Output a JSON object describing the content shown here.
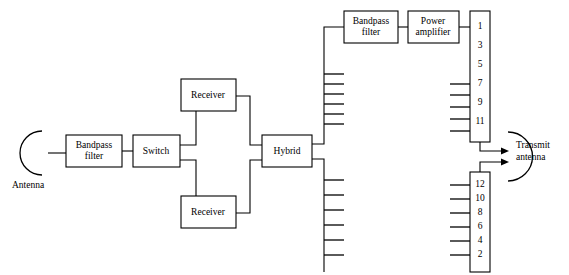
{
  "diagram": {
    "background_color": "#ffffff",
    "line_color": "#000000",
    "blocks": [
      {
        "id": "bandpass_filter_rx",
        "name": "bandpass-filter-receive",
        "line1": "Bandpass",
        "line2": "filter",
        "x": 66,
        "y": 135,
        "w": 56,
        "h": 32
      },
      {
        "id": "switch",
        "name": "switch",
        "line1": "Switch",
        "line2": "",
        "x": 133,
        "y": 135,
        "w": 47,
        "h": 32
      },
      {
        "id": "receiver_top",
        "name": "receiver-top",
        "line1": "Receiver",
        "line2": "",
        "x": 181,
        "y": 79,
        "w": 55,
        "h": 32
      },
      {
        "id": "receiver_bottom",
        "name": "receiver-bottom",
        "line1": "Receiver",
        "line2": "",
        "x": 181,
        "y": 196,
        "w": 55,
        "h": 32
      },
      {
        "id": "hybrid",
        "name": "hybrid",
        "line1": "Hybrid",
        "line2": "",
        "x": 262,
        "y": 135,
        "w": 50,
        "h": 32
      },
      {
        "id": "bandpass_filter_tx",
        "name": "bandpass-filter-transmit",
        "line1": "Bandpass",
        "line2": "filter",
        "x": 344,
        "y": 11,
        "w": 54,
        "h": 32
      },
      {
        "id": "power_amplifier",
        "name": "power-amplifier",
        "line1": "Power",
        "line2": "amplifier",
        "x": 408,
        "y": 11,
        "w": 51,
        "h": 32
      }
    ],
    "port_arrays": [
      {
        "id": "array_odd",
        "name": "port-array-odd",
        "x": 470,
        "y": 11,
        "w": 20,
        "h": 131,
        "ports": [
          "1",
          "3",
          "5",
          "7",
          "9",
          "11"
        ],
        "fed_ports": [
          "7",
          "9",
          "11"
        ],
        "stub_count": 4
      },
      {
        "id": "array_even",
        "name": "port-array-even",
        "x": 470,
        "y": 172,
        "w": 20,
        "h": 100,
        "ports": [
          "12",
          "10",
          "8",
          "6",
          "4",
          "2"
        ],
        "stub_count": 6
      }
    ],
    "antennas": [
      {
        "id": "antenna_rx",
        "name": "antenna-receive",
        "label": "Antenna",
        "label_x": 12,
        "label_y": 186
      },
      {
        "id": "antenna_tx",
        "name": "antenna-transmit",
        "label_line1": "Transmit",
        "label_line2": "antenna",
        "label_x": 516,
        "label_y": 143
      }
    ],
    "bus_stubs": {
      "upper_branch_count": 6,
      "lower_branch_count": 6
    }
  }
}
